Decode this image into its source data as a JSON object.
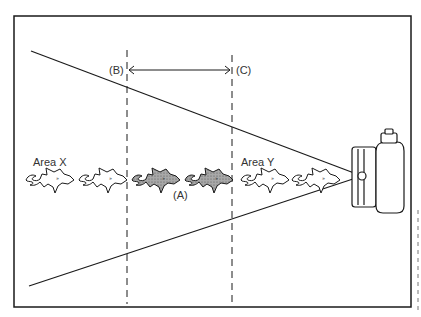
{
  "diagram": {
    "type": "camera field-of-view depth diagram",
    "labels": {
      "area_x": "Area X",
      "area_y": "Area Y",
      "point_a": "(A)",
      "point_b": "(B)",
      "point_c": "(C)"
    },
    "fish": [
      {
        "id": 1,
        "shaded": false,
        "region": "Area X"
      },
      {
        "id": 2,
        "shaded": false,
        "region": "Area X"
      },
      {
        "id": 3,
        "shaded": true,
        "region": "focus zone B-C"
      },
      {
        "id": 4,
        "shaded": true,
        "region": "focus zone B-C"
      },
      {
        "id": 5,
        "shaded": false,
        "region": "Area Y"
      },
      {
        "id": 6,
        "shaded": false,
        "region": "Area Y"
      }
    ],
    "colors": {
      "line": "#1a1a1a",
      "shaded_fish": "#9a9a9a",
      "background": "#ffffff"
    }
  }
}
